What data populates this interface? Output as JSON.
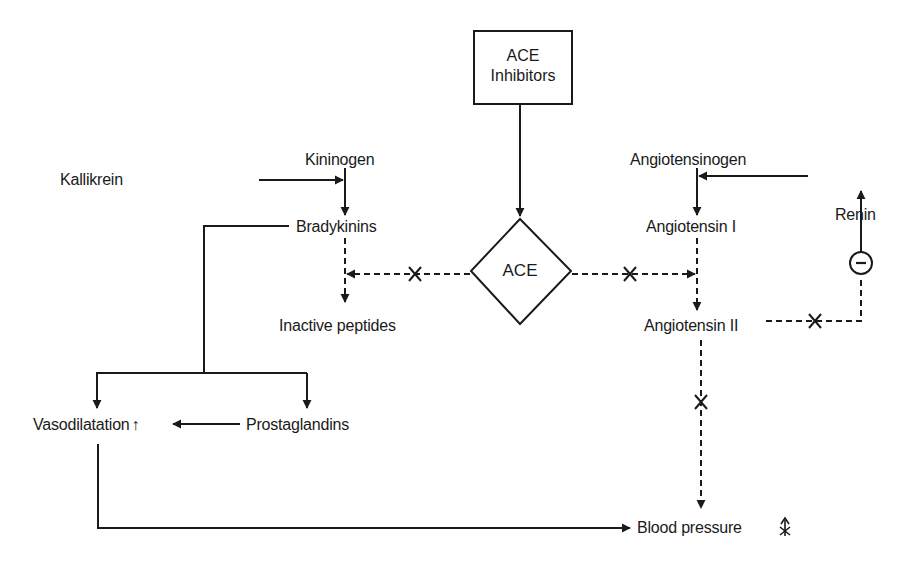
{
  "diagram": {
    "title_box": {
      "line1": "ACE",
      "line2": "Inhibitors"
    },
    "enzyme": {
      "label": "ACE"
    },
    "nodes": {
      "kininogen": "Kininogen",
      "kallikrein": "Kallikrein",
      "bradykinins": "Bradykinins",
      "inactive_peptides": "Inactive peptides",
      "angiotensinogen": "Angiotensinogen",
      "renin": "Renin",
      "angiotensin_1": "Angiotensin I",
      "angiotensin_2": "Angiotensin II",
      "vasodilatation": "Vasodilatation",
      "vasodilatation_indicator": "↑",
      "prostaglandins": "Prostaglandins",
      "blood_pressure": "Blood pressure"
    },
    "feedback_symbol": "−",
    "block_symbol": "×",
    "edges": [
      {
        "from": "ACE Inhibitors",
        "to": "ACE",
        "style": "solid",
        "type": "inhibits"
      },
      {
        "from": "Kininogen",
        "to": "Bradykinins",
        "style": "solid"
      },
      {
        "from": "Kallikrein",
        "to": "Kininogen→Bradykinins",
        "style": "solid",
        "type": "catalyzes"
      },
      {
        "from": "Bradykinins",
        "to": "Inactive peptides",
        "style": "dashed"
      },
      {
        "from": "ACE",
        "to": "Bradykinins→Inactive peptides",
        "style": "dashed",
        "blocked": true
      },
      {
        "from": "Angiotensinogen",
        "to": "Angiotensin I",
        "style": "solid"
      },
      {
        "from": "Renin",
        "to": "Angiotensinogen→Angiotensin I",
        "style": "solid",
        "type": "catalyzes"
      },
      {
        "from": "Angiotensin I",
        "to": "Angiotensin II",
        "style": "dashed"
      },
      {
        "from": "ACE",
        "to": "Angiotensin I→Angiotensin II",
        "style": "dashed",
        "blocked": true
      },
      {
        "from": "Angiotensin II",
        "to": "Renin",
        "style": "dashed",
        "blocked": true,
        "type": "negative feedback"
      },
      {
        "from": "Angiotensin II",
        "to": "Blood pressure",
        "style": "dashed",
        "blocked": true
      },
      {
        "from": "Bradykinins",
        "to": "Vasodilatation",
        "style": "solid"
      },
      {
        "from": "Bradykinins",
        "to": "Prostaglandins",
        "style": "solid"
      },
      {
        "from": "Prostaglandins",
        "to": "Vasodilatation",
        "style": "solid"
      },
      {
        "from": "Vasodilatation",
        "to": "Blood pressure",
        "style": "solid"
      }
    ]
  },
  "colors": {
    "ink": "#1a1a1a",
    "background": "#ffffff"
  }
}
